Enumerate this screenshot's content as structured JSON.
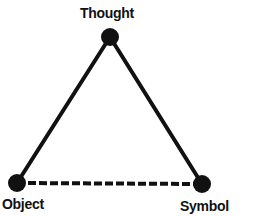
{
  "diagram": {
    "title": "",
    "type": "semiotic-triangle",
    "nodes": [
      {
        "id": "thought",
        "label": "Thought",
        "x": 110,
        "y": 37
      },
      {
        "id": "object",
        "label": "Object",
        "x": 17,
        "y": 183
      },
      {
        "id": "symbol",
        "label": "Symbol",
        "x": 202,
        "y": 184
      }
    ],
    "edges": [
      {
        "from": "thought",
        "to": "object",
        "style": "solid"
      },
      {
        "from": "thought",
        "to": "symbol",
        "style": "solid"
      },
      {
        "from": "object",
        "to": "symbol",
        "style": "dashed"
      }
    ],
    "colors": {
      "line": "#111111",
      "node": "#111111",
      "background": "#ffffff"
    }
  }
}
